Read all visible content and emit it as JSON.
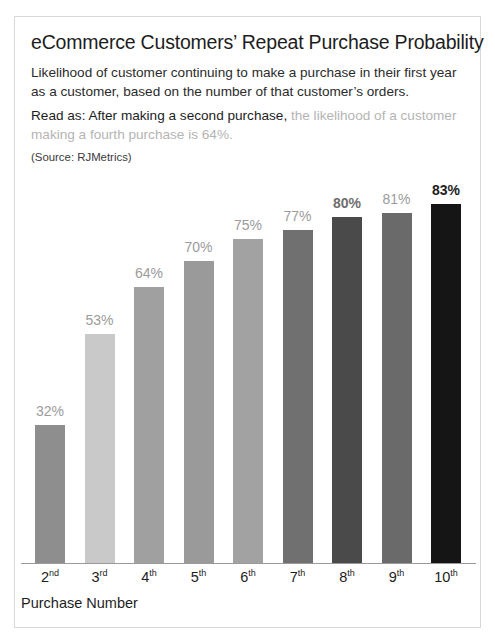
{
  "card": {
    "title": "eCommerce Customers’ Repeat Purchase Probability",
    "subtitle": "Likelihood of customer continuing to make a purchase in their first year as a customer, based on the number of that customer’s orders.",
    "read_as_dark": "Read as: After making a second purchase,",
    "read_as_light": " the likelihood of a customer making a fourth purchase is 64%.",
    "source": "(Source: RJMetrics)"
  },
  "chart_data": {
    "type": "bar",
    "title": "eCommerce Customers’ Repeat Purchase Probability",
    "subtitle": "Likelihood of customer continuing to make a purchase in their first year as a customer, based on the number of that customer’s orders.",
    "annotation": "Read as: After making a second purchase, the likelihood of a customer making a fourth purchase is 64%.",
    "source": "(Source: RJMetrics)",
    "xlabel": "Purchase Number",
    "ylabel": "",
    "ylim": [
      0,
      100
    ],
    "grid": false,
    "legend": null,
    "categories": [
      "2nd",
      "3rd",
      "4th",
      "5th",
      "6th",
      "7th",
      "8th",
      "9th",
      "10th"
    ],
    "category_ordinals": [
      {
        "num": "2",
        "suffix": "nd"
      },
      {
        "num": "3",
        "suffix": "rd"
      },
      {
        "num": "4",
        "suffix": "th"
      },
      {
        "num": "5",
        "suffix": "th"
      },
      {
        "num": "6",
        "suffix": "th"
      },
      {
        "num": "7",
        "suffix": "th"
      },
      {
        "num": "8",
        "suffix": "th"
      },
      {
        "num": "9",
        "suffix": "th"
      },
      {
        "num": "10",
        "suffix": "th"
      }
    ],
    "values": [
      32,
      53,
      64,
      70,
      75,
      77,
      80,
      81,
      83
    ],
    "value_labels": [
      "32%",
      "53%",
      "64%",
      "70%",
      "75%",
      "77%",
      "80%",
      "81%",
      "83%"
    ],
    "bar_colors": [
      "#8e8e8e",
      "#c9c9c9",
      "#a0a0a0",
      "#9a9a9a",
      "#a2a2a2",
      "#707070",
      "#4a4a4a",
      "#6a6a6a",
      "#151515"
    ],
    "label_styles": [
      "normal",
      "normal",
      "normal",
      "normal",
      "normal",
      "normal",
      "semi",
      "normal",
      "emph"
    ]
  }
}
